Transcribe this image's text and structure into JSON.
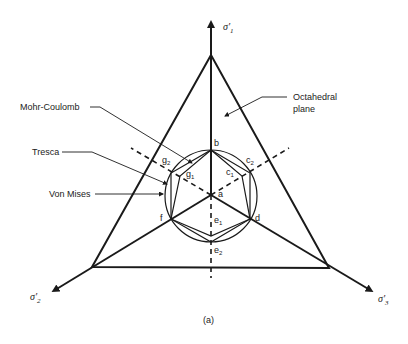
{
  "labels": {
    "mohr_coulomb": "Mohr-Coulomb",
    "tresca": "Tresca",
    "von_mises": "Von Mises",
    "octahedral_1": "Octahedral",
    "octahedral_2": "plane"
  },
  "axes": {
    "sigma1": "σ'",
    "sigma1_sub": "1",
    "sigma2": "σ'",
    "sigma2_sub": "2",
    "sigma3": "σ'",
    "sigma3_sub": "3"
  },
  "points": {
    "a": "a",
    "b": "b",
    "c1": "c",
    "c1_sub": "1",
    "c2": "c",
    "c2_sub": "2",
    "d": "d",
    "e1": "e",
    "e1_sub": "1",
    "e2": "e",
    "e2_sub": "2",
    "f": "f",
    "g1": "g",
    "g1_sub": "1",
    "g2": "g",
    "g2_sub": "2"
  },
  "caption": "(a)",
  "colors": {
    "ink": "#1a1a1a",
    "background": "#ffffff"
  }
}
